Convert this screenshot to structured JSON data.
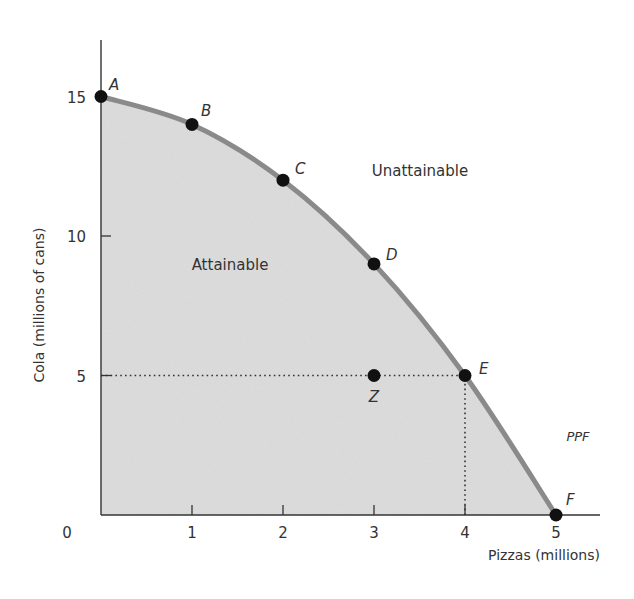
{
  "chart_data": {
    "type": "line",
    "title": "",
    "xlabel": "Pizzas (millions)",
    "ylabel": "Cola (millions of cans)",
    "xlim": [
      0,
      5.5
    ],
    "ylim": [
      0,
      17
    ],
    "x_ticks": [
      0,
      1,
      2,
      3,
      4,
      5
    ],
    "x_tick_labels": [
      "0",
      "1",
      "2",
      "3",
      "4",
      "5"
    ],
    "y_ticks": [
      5,
      10,
      15
    ],
    "y_tick_labels": [
      "5",
      "10",
      "15"
    ],
    "grid": false,
    "legend": null,
    "series": [
      {
        "name": "PPF",
        "points": [
          {
            "label": "A",
            "x": 0,
            "y": 15
          },
          {
            "label": "B",
            "x": 1,
            "y": 14
          },
          {
            "label": "C",
            "x": 2,
            "y": 12
          },
          {
            "label": "D",
            "x": 3,
            "y": 9
          },
          {
            "label": "E",
            "x": 4,
            "y": 5
          },
          {
            "label": "F",
            "x": 5,
            "y": 0
          }
        ]
      }
    ],
    "extra_points": [
      {
        "label": "Z",
        "x": 3,
        "y": 5
      }
    ],
    "reference_lines": [
      {
        "type": "horizontal",
        "y": 5,
        "from_x": 0,
        "to_x": 4,
        "style": "dotted"
      },
      {
        "type": "vertical",
        "x": 4,
        "from_y": 0,
        "to_y": 5,
        "style": "dotted"
      }
    ],
    "annotations": [
      {
        "text": "Attainable",
        "x": 1.6,
        "y": 9
      },
      {
        "text": "Unattainable",
        "x": 3.3,
        "y": 12.3
      },
      {
        "text": "PPF",
        "x": 4.8,
        "y": 2.8
      }
    ],
    "shaded_region": "area under PPF (attainable)",
    "colors": {
      "curve": "#8a8a8a",
      "fill": "#dcdcdc",
      "points": "#111111",
      "axis": "#333333"
    }
  }
}
